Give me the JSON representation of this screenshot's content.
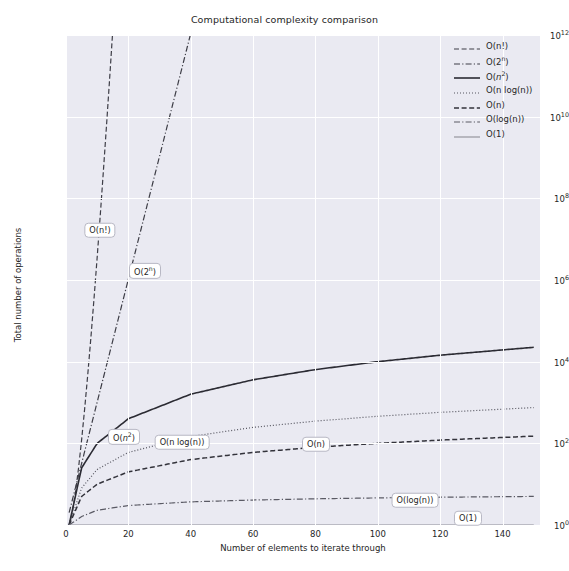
{
  "chart_data": {
    "type": "line",
    "title": "Computational complexity comparison",
    "xlabel": "Number of elements to iterate through",
    "ylabel": "Total number of operations",
    "xlim": [
      0,
      152
    ],
    "ylim": [
      1,
      1000000000000
    ],
    "yscale": "log",
    "xscale": "linear",
    "grid": true,
    "legend_position": "upper right",
    "xticks": [
      "0",
      "20",
      "40",
      "60",
      "80",
      "100",
      "120",
      "140"
    ],
    "xtick_values": [
      0,
      20,
      40,
      60,
      80,
      100,
      120,
      140
    ],
    "yticks": [
      "10^0",
      "10^2",
      "10^4",
      "10^6",
      "10^8",
      "10^10",
      "10^12"
    ],
    "ytick_values": [
      1,
      100,
      10000,
      1000000,
      100000000,
      10000000000,
      1000000000000
    ],
    "series": [
      {
        "name": "O(n!)",
        "label_html": "O(n!)",
        "style": "dashed",
        "color": "#3d3d46",
        "width": 1.2,
        "annotation": "O(n!)",
        "annotation_x": 100,
        "annotation_y": 230,
        "x": [
          1,
          2,
          3,
          4,
          5,
          6,
          7,
          8,
          9,
          10,
          11,
          12,
          13,
          14,
          15
        ],
        "y": [
          1,
          2,
          6,
          24,
          120,
          720,
          5040,
          40320,
          362880,
          3628800,
          39916800,
          479001600,
          6227020800,
          87178291200,
          1307674368000
        ]
      },
      {
        "name": "O(2^n)",
        "label_html": "O(2<sup>n</sup>)",
        "style": "dashdot",
        "color": "#3d3d46",
        "width": 1.2,
        "annotation": "O(2^n)",
        "annotation_x": 145,
        "annotation_y": 271,
        "x": [
          1,
          5,
          10,
          15,
          20,
          25,
          30,
          35,
          40
        ],
        "y": [
          2,
          32,
          1024,
          32768,
          1048576,
          33554432,
          1073741824,
          34359738368,
          1099511627776
        ]
      },
      {
        "name": "O(n^2)",
        "label_html": "O(<i>n</i><sup>2</sup>)",
        "style": "solid",
        "color": "#2b2b33",
        "width": 1.6,
        "annotation": "O(n^2)",
        "annotation_x": 124,
        "annotation_y": 437,
        "x": [
          1,
          5,
          10,
          20,
          40,
          60,
          80,
          100,
          120,
          150
        ],
        "y": [
          1,
          25,
          100,
          400,
          1600,
          3600,
          6400,
          10000,
          14400,
          22500
        ]
      },
      {
        "name": "O(n log(n))",
        "label_html": "O(n log(n))",
        "style": "dotted",
        "color": "#55555f",
        "width": 1.2,
        "annotation": "O(n log(n))",
        "annotation_x": 182,
        "annotation_y": 442,
        "x": [
          1,
          5,
          10,
          20,
          40,
          60,
          80,
          100,
          120,
          150
        ],
        "y": [
          1,
          8,
          23,
          60,
          147,
          246,
          350,
          460,
          574,
          751
        ]
      },
      {
        "name": "O(n)",
        "label_html": "O(n)",
        "style": "dashed",
        "color": "#33333b",
        "width": 1.5,
        "annotation": "O(n)",
        "annotation_x": 316,
        "annotation_y": 444,
        "x": [
          1,
          5,
          10,
          20,
          40,
          60,
          80,
          100,
          120,
          150
        ],
        "y": [
          1,
          5,
          10,
          20,
          40,
          60,
          80,
          100,
          120,
          150
        ]
      },
      {
        "name": "O(log(n))",
        "label_html": "O(log(n))",
        "style": "dashdot",
        "color": "#5a5a64",
        "width": 1.2,
        "annotation": "O(log(n))",
        "annotation_x": 415,
        "annotation_y": 500,
        "x": [
          1,
          5,
          10,
          20,
          40,
          60,
          80,
          100,
          120,
          150
        ],
        "y": [
          1,
          1.61,
          2.3,
          3.0,
          3.69,
          4.09,
          4.38,
          4.61,
          4.79,
          5.01
        ]
      },
      {
        "name": "O(1)",
        "label_html": "O(1)",
        "style": "solid",
        "color": "#8c8c96",
        "width": 1.1,
        "annotation": "O(1)",
        "annotation_x": 468,
        "annotation_y": 518,
        "x": [
          1,
          150
        ],
        "y": [
          1,
          1
        ]
      }
    ]
  },
  "colors": {
    "plot_background": "#eaeaf2",
    "figure_background": "#ffffff",
    "grid": "#ffffff",
    "text": "#262626"
  }
}
